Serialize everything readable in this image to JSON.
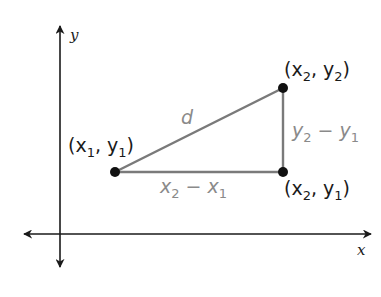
{
  "diagram": {
    "axes": {
      "x_label": "x",
      "y_label": "y"
    },
    "points": [
      {
        "id": "p1",
        "label_open": "(x",
        "sub1": "1",
        "mid": ", y",
        "sub2": "1",
        "close": ")",
        "full": "(x1, y1)"
      },
      {
        "id": "p2",
        "label_open": "(x",
        "sub1": "2",
        "mid": ", y",
        "sub2": "2",
        "close": ")",
        "full": "(x2, y2)"
      },
      {
        "id": "p3",
        "label_open": "(x",
        "sub1": "2",
        "mid": ", y",
        "sub2": "1",
        "close": ")",
        "full": "(x2, y1)"
      }
    ],
    "segments": {
      "hypotenuse": "d",
      "horizontal": {
        "a": "x",
        "a_sub": "2",
        "op": " − ",
        "b": "x",
        "b_sub": "1",
        "full": "x2 − x1"
      },
      "vertical": {
        "a": "y",
        "a_sub": "2",
        "op": " − ",
        "b": "y",
        "b_sub": "1",
        "full": "y2 − y1"
      }
    },
    "colors": {
      "axis": "#1a1a1a",
      "segment": "#7a7a7a",
      "segment_label": "#8a8a8a",
      "point": "#111111",
      "point_label": "#1a1a1a"
    }
  }
}
